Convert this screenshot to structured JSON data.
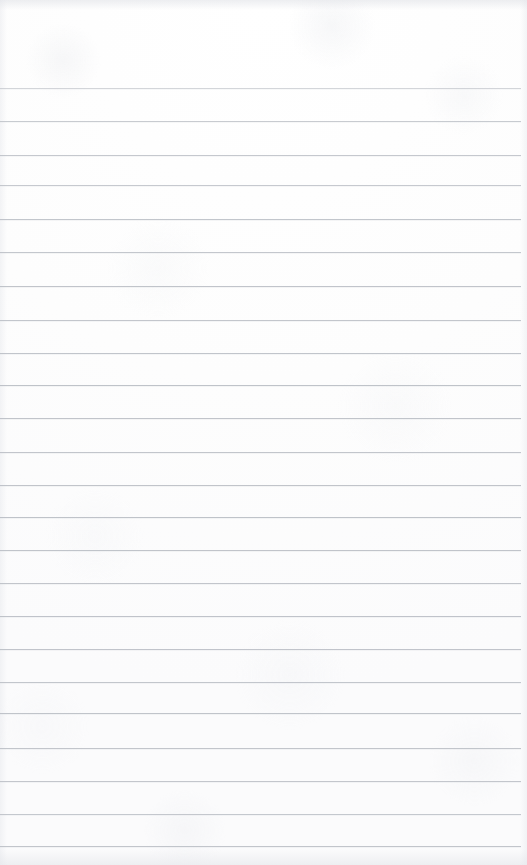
{
  "document": {
    "type": "ruled-notebook-page",
    "title": "Blank lined notebook page",
    "content_text": "",
    "page_width": 527,
    "page_height": 865,
    "background_color": "#fefefe",
    "paper_tone": "#fdfdfd",
    "is_blank": true
  },
  "ruling": {
    "line_color": "#b9bdc4",
    "line_thickness": 1,
    "line_count": 23,
    "line_spacing": 33.25,
    "first_line_y": 88,
    "last_line_y": 846,
    "line_start_x": 0,
    "line_end_x": 521,
    "has_left_margin_rule": false,
    "has_header_rule": false
  },
  "header_area": {
    "height": 88,
    "content_text": "",
    "label": "top margin"
  },
  "lines": [
    {
      "index": 1,
      "y": 88,
      "text": "",
      "opacity": 0.62
    },
    {
      "index": 2,
      "y": 121,
      "text": "",
      "opacity": 0.78
    },
    {
      "index": 3,
      "y": 155,
      "text": "",
      "opacity": 0.82
    },
    {
      "index": 4,
      "y": 185,
      "text": "",
      "opacity": 0.8
    },
    {
      "index": 5,
      "y": 219,
      "text": "",
      "opacity": 0.86
    },
    {
      "index": 6,
      "y": 252,
      "text": "",
      "opacity": 0.84
    },
    {
      "index": 7,
      "y": 286,
      "text": "",
      "opacity": 0.88
    },
    {
      "index": 8,
      "y": 320,
      "text": "",
      "opacity": 0.85
    },
    {
      "index": 9,
      "y": 353,
      "text": "",
      "opacity": 0.87
    },
    {
      "index": 10,
      "y": 385,
      "text": "",
      "opacity": 0.9
    },
    {
      "index": 11,
      "y": 418,
      "text": "",
      "opacity": 0.88
    },
    {
      "index": 12,
      "y": 452,
      "text": "",
      "opacity": 0.86
    },
    {
      "index": 13,
      "y": 485,
      "text": "",
      "opacity": 0.88
    },
    {
      "index": 14,
      "y": 517,
      "text": "",
      "opacity": 0.9
    },
    {
      "index": 15,
      "y": 550,
      "text": "",
      "opacity": 0.88
    },
    {
      "index": 16,
      "y": 583,
      "text": "",
      "opacity": 0.86
    },
    {
      "index": 17,
      "y": 616,
      "text": "",
      "opacity": 0.89
    },
    {
      "index": 18,
      "y": 649,
      "text": "",
      "opacity": 0.87
    },
    {
      "index": 19,
      "y": 682,
      "text": "",
      "opacity": 0.85
    },
    {
      "index": 20,
      "y": 713,
      "text": "",
      "opacity": 0.88
    },
    {
      "index": 21,
      "y": 748,
      "text": "",
      "opacity": 0.86
    },
    {
      "index": 22,
      "y": 781,
      "text": "",
      "opacity": 0.84
    },
    {
      "index": 23,
      "y": 814,
      "text": "",
      "opacity": 0.82
    },
    {
      "index": 24,
      "y": 846,
      "text": "",
      "opacity": 0.86
    }
  ]
}
